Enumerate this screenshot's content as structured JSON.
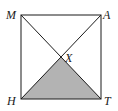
{
  "diagram": {
    "type": "geometry",
    "points": {
      "M": {
        "label": "M",
        "x": 21,
        "y": 15
      },
      "A": {
        "label": "A",
        "x": 101,
        "y": 15
      },
      "H": {
        "label": "H",
        "x": 21,
        "y": 99
      },
      "T": {
        "label": "T",
        "x": 101,
        "y": 99
      },
      "X": {
        "label": "X",
        "x": 61,
        "y": 57
      }
    },
    "shaded_region": [
      "H",
      "X",
      "T"
    ],
    "colors": {
      "stroke": "#1a1a1a",
      "shade": "#b3b3b3",
      "background": "#ffffff"
    }
  }
}
